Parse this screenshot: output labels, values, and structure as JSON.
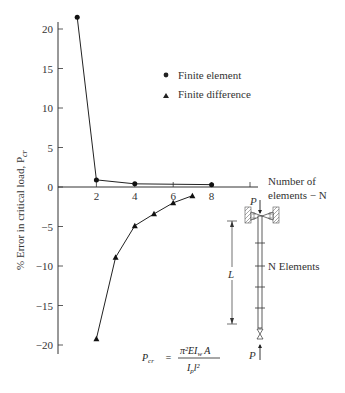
{
  "chart_data": {
    "type": "line",
    "title": "",
    "xlabel": "Number of elements − N",
    "ylabel": "% Error in critical load, P_cr",
    "xlim": [
      0,
      10.5
    ],
    "ylim": [
      -21,
      22
    ],
    "grid": false,
    "legend_position": "upper right",
    "x_ticks": [
      2,
      4,
      6,
      8,
      10
    ],
    "x_tick_labels": [
      "2",
      "4",
      "6",
      "8",
      ""
    ],
    "y_ticks": [
      20,
      15,
      10,
      5,
      0,
      -5,
      -10,
      -15,
      -20
    ],
    "y_tick_labels": [
      "20",
      "15",
      "10",
      "5",
      "0",
      "−5",
      "−10",
      "−15",
      "−20"
    ],
    "series": [
      {
        "name": "Finite element",
        "marker": "circle",
        "x": [
          1,
          2,
          4,
          8
        ],
        "values": [
          21.5,
          0.9,
          0.4,
          0.3
        ]
      },
      {
        "name": "Finite difference",
        "marker": "triangle",
        "x": [
          2,
          3,
          4,
          5,
          6,
          7
        ],
        "values": [
          -19.2,
          -8.9,
          -4.9,
          -3.4,
          -2.0,
          -1.1
        ]
      }
    ],
    "annotations": [
      "P_cr = π² E I_w A / (I_p l²)",
      "Column diagram with load P, length L, N Elements"
    ]
  },
  "legend": {
    "items": [
      {
        "label": "Finite element",
        "marker": "circle"
      },
      {
        "label": "Finite difference",
        "marker": "triangle"
      }
    ]
  },
  "axes": {
    "y_label": "% Error in critical load, P",
    "y_label_sub": "cr",
    "x_label_line1": "Number of",
    "x_label_line2": "elements − N"
  },
  "formula": {
    "lhs": "P",
    "lhs_sub": "cr",
    "equals": "=",
    "numerator": "π²EI",
    "numerator_sub": "w",
    "numerator_tail": "A",
    "denominator": "I",
    "denominator_sub": "p",
    "denominator_tail": "l²"
  },
  "diagram": {
    "load_top": "P",
    "load_bottom": "P",
    "length_label": "L",
    "elements_label": "N Elements"
  }
}
